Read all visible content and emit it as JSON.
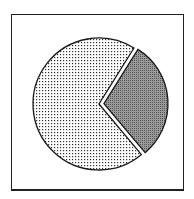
{
  "chart_data": {
    "type": "pie",
    "title": "",
    "legend": [],
    "slices": [
      {
        "name": "slice-large",
        "value": 70,
        "pattern": "light-dots",
        "exploded": false
      },
      {
        "name": "slice-small",
        "value": 30,
        "pattern": "dense-dots",
        "exploded": true
      }
    ],
    "start_angle_deg": -62,
    "labels_visible": false
  },
  "colors": {
    "outline": "#1a1a1a",
    "light_fill": "#e8e8e8",
    "dense_fill": "#a8a8a8",
    "background": "#ffffff"
  }
}
